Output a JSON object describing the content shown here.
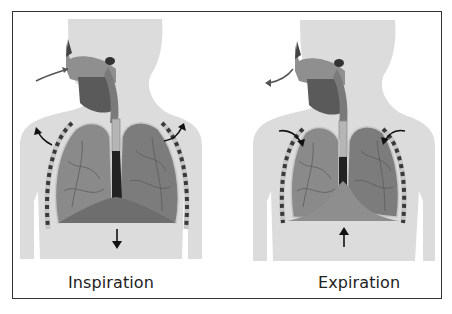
{
  "diagram": {
    "title": "",
    "panels": [
      {
        "id": "inspiration",
        "label": "Inspiration",
        "airflow": "inward",
        "chest_wall_arrows": "outward",
        "diaphragm_arrow": "down"
      },
      {
        "id": "expiration",
        "label": "Expiration",
        "airflow": "outward",
        "chest_wall_arrows": "inward",
        "diaphragm_arrow": "up"
      }
    ],
    "colors": {
      "body": "#dcdcdc",
      "lung": "#8a8a8a",
      "lung_dark": "#555555",
      "diaphragm": "#6e6e6e",
      "rib": "#3a3a3a",
      "arrow": "#111111",
      "border": "#333333"
    }
  }
}
